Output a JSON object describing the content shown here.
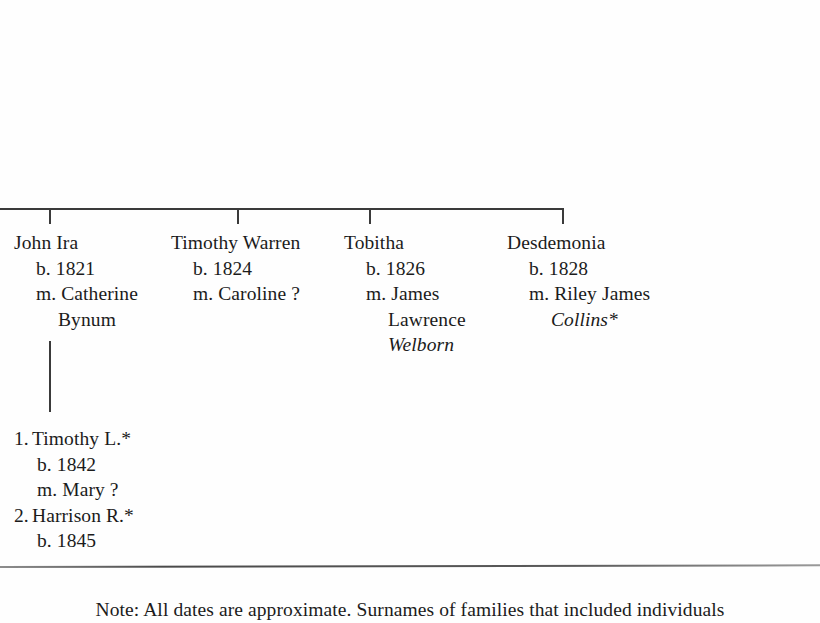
{
  "document": {
    "kind": "genealogy-chart-scan",
    "ink_color": "#1b1b1b",
    "rule_color": "#4a4a4a",
    "line_color": "#3a3a3a"
  },
  "generation": {
    "people": [
      {
        "id": "john-ira",
        "name": "John Ira",
        "birth": "b. 1821",
        "marriage": "m. Catherine",
        "marriage_surname": "Bynum",
        "surname_italic": false
      },
      {
        "id": "timothy-warren",
        "name": "Timothy Warren",
        "birth": "b. 1824",
        "marriage": "m. Caroline ?",
        "marriage_surname": "",
        "surname_italic": false
      },
      {
        "id": "tobitha",
        "name": "Tobitha",
        "birth": "b. 1826",
        "marriage": "m. James",
        "marriage_given2": "Lawrence",
        "marriage_surname": "Welborn",
        "surname_italic": true
      },
      {
        "id": "desdemonia",
        "name": "Desdemonia",
        "birth": "b. 1828",
        "marriage": "m. Riley James",
        "marriage_surname": "Collins*",
        "surname_italic": true
      }
    ]
  },
  "children": {
    "parent_ref": "john-ira",
    "items": [
      {
        "number": "1.",
        "name": "Timothy L.*",
        "birth": "b. 1842",
        "marriage": "m. Mary ?"
      },
      {
        "number": "2.",
        "name": "Harrison R.*",
        "birth": "b. 1845",
        "marriage": ""
      }
    ]
  },
  "note": {
    "line1": "Note: All dates are approximate. Surnames of families that included individuals",
    "line2": ""
  }
}
